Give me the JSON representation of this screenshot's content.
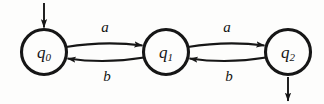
{
  "figure": {
    "kind": "finite-state-automaton-diagram",
    "background_color": "#fdfdfc",
    "ink_color": "#161616"
  },
  "states": [
    {
      "id": "q0",
      "name": "q",
      "subscript": "0",
      "cx": 44,
      "cy": 52,
      "r": 23,
      "is_start": true,
      "is_final": false
    },
    {
      "id": "q1",
      "name": "q",
      "subscript": "1",
      "cx": 166,
      "cy": 52,
      "r": 23,
      "is_start": false,
      "is_final": false
    },
    {
      "id": "q2",
      "name": "q",
      "subscript": "2",
      "cx": 288,
      "cy": 52,
      "r": 23,
      "is_start": false,
      "is_final": false
    }
  ],
  "transitions": [
    {
      "id": "t-q0-q1-a",
      "from": "q0",
      "to": "q1",
      "label": "a",
      "direction": "right",
      "label_x": 105,
      "label_y": 27
    },
    {
      "id": "t-q1-q0-b",
      "from": "q1",
      "to": "q0",
      "label": "b",
      "direction": "left",
      "label_x": 107,
      "label_y": 76
    },
    {
      "id": "t-q1-q2-a",
      "from": "q1",
      "to": "q2",
      "label": "a",
      "direction": "right",
      "label_x": 227,
      "label_y": 27
    },
    {
      "id": "t-q2-q1-b",
      "from": "q2",
      "to": "q1",
      "label": "b",
      "direction": "left",
      "label_x": 229,
      "label_y": 76
    }
  ],
  "markers": [
    {
      "id": "start-arrow",
      "role": "start-arrow",
      "target": "q0",
      "orientation": "down",
      "x": 44,
      "y_from": 3,
      "y_to": 27
    },
    {
      "id": "exit-arrow",
      "role": "exit-arrow",
      "source": "q2",
      "orientation": "down",
      "x": 288,
      "y_from": 77,
      "y_to": 101
    }
  ]
}
